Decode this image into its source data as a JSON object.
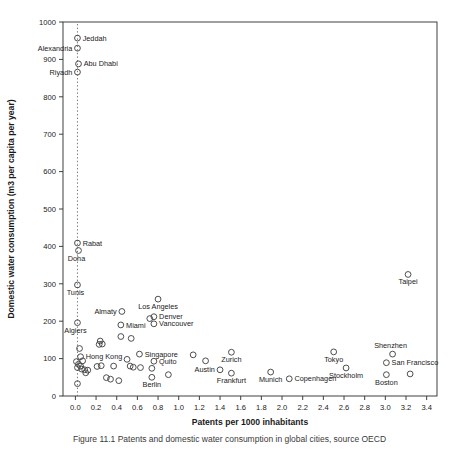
{
  "figure": {
    "caption": "Figure 11.1  Patents and domestic water consumption in global cities, source OECD"
  },
  "chart_data": {
    "type": "scatter",
    "title": "",
    "xlabel": "Patents per 1000 inhabitants",
    "ylabel": "Domestic water consumption (m3 per capita per year)",
    "xlim": [
      -0.12,
      3.5
    ],
    "ylim": [
      0,
      1000
    ],
    "xticks": [
      "0.0",
      "0.2",
      "0.4",
      "0.6",
      "0.8",
      "1.0",
      "1.2",
      "1.4",
      "1.6",
      "1.8",
      "2.0",
      "2.2",
      "2.4",
      "2.6",
      "2.8",
      "3.0",
      "3.2",
      "3.4"
    ],
    "xtickvals": [
      0.0,
      0.2,
      0.4,
      0.6,
      0.8,
      1.0,
      1.2,
      1.4,
      1.6,
      1.8,
      2.0,
      2.2,
      2.4,
      2.6,
      2.8,
      3.0,
      3.2,
      3.4
    ],
    "yticks": [
      "0",
      "100",
      "200",
      "300",
      "400",
      "500",
      "600",
      "700",
      "800",
      "900",
      "1000"
    ],
    "ytickvals": [
      0,
      100,
      200,
      300,
      400,
      500,
      600,
      700,
      800,
      900,
      1000
    ],
    "grid": false,
    "legend": null,
    "marker": "open-circle",
    "marker_color": "#444444",
    "reference_line": {
      "type": "vertical-dotted",
      "x": 0.02,
      "color": "#555555"
    },
    "points": [
      {
        "city": "Jeddah",
        "x": 0.02,
        "y": 957,
        "label": "Jeddah",
        "lp": "right"
      },
      {
        "city": "Alexandria",
        "x": 0.02,
        "y": 930,
        "label": "Alexandria",
        "lp": "left"
      },
      {
        "city": "Abu Dhabi",
        "x": 0.03,
        "y": 888,
        "label": "Abu Dhabi",
        "lp": "right"
      },
      {
        "city": "Riyadh",
        "x": 0.02,
        "y": 866,
        "label": "Riyadh",
        "lp": "left"
      },
      {
        "city": "Rabat",
        "x": 0.02,
        "y": 409,
        "label": "Rabat",
        "lp": "right"
      },
      {
        "city": "Doha",
        "x": 0.03,
        "y": 389,
        "label": "Doha",
        "lp": "below-left"
      },
      {
        "city": "Tunis",
        "x": 0.02,
        "y": 297,
        "label": "Tunis",
        "lp": "below-left"
      },
      {
        "city": "Algiers",
        "x": 0.02,
        "y": 196,
        "label": "Algiers",
        "lp": "below-left"
      },
      {
        "city": "Taipei",
        "x": 3.22,
        "y": 325,
        "label": "Taipei",
        "lp": "below"
      },
      {
        "city": "Los Angeles",
        "x": 0.8,
        "y": 259,
        "label": "Los Angeles",
        "lp": "below"
      },
      {
        "city": "Almaty",
        "x": 0.45,
        "y": 226,
        "label": "Almaty",
        "lp": "left"
      },
      {
        "city": "Denver",
        "x": 0.76,
        "y": 212,
        "label": "Denver",
        "lp": "right"
      },
      {
        "city": "Denver2",
        "x": 0.72,
        "y": 207,
        "label": "",
        "lp": "none"
      },
      {
        "city": "Vancouver",
        "x": 0.76,
        "y": 193,
        "label": "Vancouver",
        "lp": "right"
      },
      {
        "city": "Miami",
        "x": 0.44,
        "y": 190,
        "label": "Miami",
        "lp": "right"
      },
      {
        "city": "unl_1",
        "x": 0.24,
        "y": 147,
        "label": "",
        "lp": "none"
      },
      {
        "city": "unl_2",
        "x": 0.26,
        "y": 139,
        "label": "",
        "lp": "none"
      },
      {
        "city": "unl_3",
        "x": 0.23,
        "y": 138,
        "label": "",
        "lp": "none"
      },
      {
        "city": "unl_4",
        "x": 0.44,
        "y": 159,
        "label": "",
        "lp": "none"
      },
      {
        "city": "unl_5",
        "x": 0.54,
        "y": 154,
        "label": "",
        "lp": "none"
      },
      {
        "city": "Singapore",
        "x": 0.62,
        "y": 112,
        "label": "Singapore",
        "lp": "right"
      },
      {
        "city": "unl_6",
        "x": 0.04,
        "y": 127,
        "label": "",
        "lp": "none"
      },
      {
        "city": "HongKong",
        "x": 0.05,
        "y": 105,
        "label": "Hong Kong",
        "lp": "right"
      },
      {
        "city": "unl_7",
        "x": 0.07,
        "y": 94,
        "label": "",
        "lp": "none"
      },
      {
        "city": "unl_8",
        "x": 0.01,
        "y": 92,
        "label": "",
        "lp": "none"
      },
      {
        "city": "unl_9",
        "x": 0.03,
        "y": 85,
        "label": "",
        "lp": "none"
      },
      {
        "city": "unl_10",
        "x": 0.05,
        "y": 80,
        "label": "",
        "lp": "none"
      },
      {
        "city": "unl_11",
        "x": 0.02,
        "y": 76,
        "label": "",
        "lp": "none"
      },
      {
        "city": "unl_12",
        "x": 0.06,
        "y": 72,
        "label": "",
        "lp": "none"
      },
      {
        "city": "unl_13",
        "x": 0.09,
        "y": 70,
        "label": "",
        "lp": "none"
      },
      {
        "city": "unl_14",
        "x": 0.12,
        "y": 69,
        "label": "",
        "lp": "none"
      },
      {
        "city": "unl_15",
        "x": 0.1,
        "y": 62,
        "label": "",
        "lp": "none"
      },
      {
        "city": "unl_16",
        "x": 0.02,
        "y": 33,
        "label": "",
        "lp": "none"
      },
      {
        "city": "unl_17",
        "x": 0.21,
        "y": 79,
        "label": "",
        "lp": "none"
      },
      {
        "city": "unl_18",
        "x": 0.25,
        "y": 81,
        "label": "",
        "lp": "none"
      },
      {
        "city": "unl_19",
        "x": 0.3,
        "y": 49,
        "label": "",
        "lp": "none"
      },
      {
        "city": "unl_20",
        "x": 0.34,
        "y": 45,
        "label": "",
        "lp": "none"
      },
      {
        "city": "unl_21",
        "x": 0.37,
        "y": 80,
        "label": "",
        "lp": "none"
      },
      {
        "city": "unl_22",
        "x": 0.42,
        "y": 41,
        "label": "",
        "lp": "none"
      },
      {
        "city": "unl_23",
        "x": 0.5,
        "y": 98,
        "label": "",
        "lp": "none"
      },
      {
        "city": "unl_24",
        "x": 0.53,
        "y": 80,
        "label": "",
        "lp": "none"
      },
      {
        "city": "unl_25",
        "x": 0.56,
        "y": 77,
        "label": "",
        "lp": "none"
      },
      {
        "city": "unl_26",
        "x": 0.63,
        "y": 76,
        "label": "",
        "lp": "none"
      },
      {
        "city": "Quito",
        "x": 0.76,
        "y": 93,
        "label": "Quito",
        "lp": "right"
      },
      {
        "city": "unl_27",
        "x": 0.74,
        "y": 74,
        "label": "",
        "lp": "none"
      },
      {
        "city": "Berlin",
        "x": 0.74,
        "y": 50,
        "label": "Berlin",
        "lp": "below"
      },
      {
        "city": "unl_28",
        "x": 0.9,
        "y": 57,
        "label": "",
        "lp": "none"
      },
      {
        "city": "unl_29",
        "x": 1.14,
        "y": 110,
        "label": "",
        "lp": "none"
      },
      {
        "city": "unl_30",
        "x": 1.26,
        "y": 94,
        "label": "",
        "lp": "none"
      },
      {
        "city": "Austin",
        "x": 1.4,
        "y": 70,
        "label": "Austin",
        "lp": "left"
      },
      {
        "city": "Zurich",
        "x": 1.51,
        "y": 117,
        "label": "Zurich",
        "lp": "below"
      },
      {
        "city": "Frankfurt",
        "x": 1.51,
        "y": 61,
        "label": "Frankfurt",
        "lp": "below"
      },
      {
        "city": "Munich",
        "x": 1.89,
        "y": 64,
        "label": "Munich",
        "lp": "below"
      },
      {
        "city": "Copenhagen",
        "x": 2.07,
        "y": 46,
        "label": "Copenhagen",
        "lp": "right"
      },
      {
        "city": "Tokyo",
        "x": 2.5,
        "y": 118,
        "label": "Tokyo",
        "lp": "below"
      },
      {
        "city": "Stockholm",
        "x": 2.62,
        "y": 75,
        "label": "Stockholm",
        "lp": "below"
      },
      {
        "city": "Shenzhen",
        "x": 3.07,
        "y": 112,
        "label": "Shenzhen",
        "lp": "above-left"
      },
      {
        "city": "SanFrancisco",
        "x": 3.01,
        "y": 89,
        "label": "San Francisco",
        "lp": "right"
      },
      {
        "city": "Boston",
        "x": 3.01,
        "y": 57,
        "label": "Boston",
        "lp": "below"
      },
      {
        "city": "unl_31",
        "x": 3.24,
        "y": 59,
        "label": "",
        "lp": "none"
      }
    ]
  }
}
